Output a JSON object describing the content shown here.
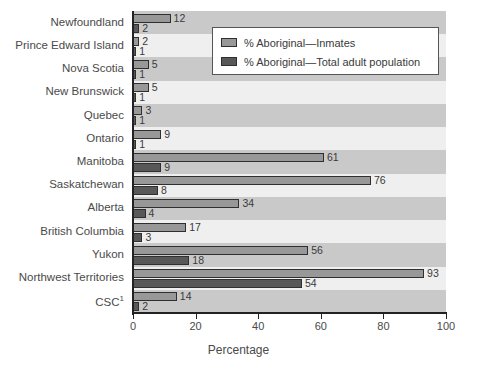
{
  "chart_data": {
    "type": "bar",
    "orientation": "horizontal",
    "title": "",
    "xlabel": "Percentage",
    "ylabel": "",
    "xlim": [
      0,
      100
    ],
    "xticks": [
      0,
      20,
      40,
      60,
      80,
      100
    ],
    "grid": false,
    "banded_background": true,
    "legend_position": "top-right",
    "categories": [
      "Newfoundland",
      "Prince Edward Island",
      "Nova Scotia",
      "New Brunswick",
      "Quebec",
      "Ontario",
      "Manitoba",
      "Saskatchewan",
      "Alberta",
      "British Columbia",
      "Yukon",
      "Northwest Territories",
      "CSC"
    ],
    "category_footnote_markers": {
      "CSC": "1"
    },
    "series": [
      {
        "name": "% Aboriginal—Inmates",
        "color": "#989898",
        "values": [
          12,
          2,
          5,
          5,
          3,
          9,
          61,
          76,
          34,
          17,
          56,
          93,
          14
        ]
      },
      {
        "name": "% Aboriginal—Total adult population",
        "color": "#585858",
        "values": [
          2,
          1,
          1,
          1,
          1,
          1,
          9,
          8,
          4,
          3,
          18,
          54,
          2
        ]
      }
    ]
  },
  "legend": {
    "items": [
      {
        "label": "% Aboriginal—Inmates",
        "swatch": "inmates"
      },
      {
        "label": "% Aboriginal—Total adult population",
        "swatch": "total"
      }
    ]
  },
  "axis": {
    "x_title": "Percentage",
    "tick_labels": [
      "0",
      "20",
      "40",
      "60",
      "80",
      "100"
    ]
  },
  "colors": {
    "inmates": "#989898",
    "total": "#585858",
    "plot_background": "#efefef",
    "band": "#c9c9c9",
    "axis": "#222222"
  }
}
